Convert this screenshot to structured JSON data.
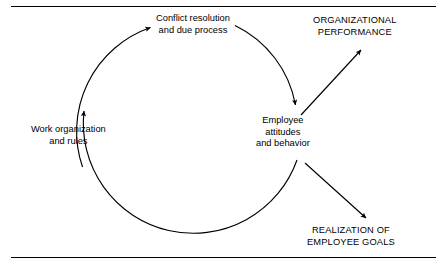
{
  "figure": {
    "type": "cycle-diagram",
    "rules": {
      "top": "horizontal-rule",
      "bottom": "horizontal-rule"
    }
  },
  "cycle": {
    "nodes": [
      {
        "id": "conflict-resolution",
        "lines": [
          "Conflict resolution",
          "and due process"
        ],
        "case": "sentence"
      },
      {
        "id": "employee-attitudes",
        "lines": [
          "Employee",
          "attitudes",
          "and behavior"
        ],
        "case": "sentence"
      },
      {
        "id": "work-organization",
        "lines": [
          "Work organization",
          "and rules"
        ],
        "case": "sentence"
      }
    ]
  },
  "outcomes": [
    {
      "id": "organizational-performance",
      "lines": [
        "ORGANIZATIONAL",
        "PERFORMANCE"
      ],
      "case": "upper"
    },
    {
      "id": "realization-of-employee-goals",
      "lines": [
        "REALIZATION OF",
        "EMPLOYEE GOALS"
      ],
      "case": "upper"
    }
  ],
  "arrows": [
    {
      "id": "work-to-conflict",
      "style": "curved",
      "from": "work-organization",
      "to": "conflict-resolution",
      "direction": "up-right"
    },
    {
      "id": "conflict-to-employee",
      "style": "curved",
      "from": "conflict-resolution",
      "to": "employee-attitudes",
      "direction": "down-right"
    },
    {
      "id": "employee-to-work",
      "style": "curved",
      "from": "employee-attitudes",
      "to": "work-organization",
      "direction": "up-left"
    },
    {
      "id": "employee-to-organizational-performance",
      "style": "straight",
      "from": "employee-attitudes",
      "to": "organizational-performance",
      "direction": "up-right"
    },
    {
      "id": "employee-to-employee-goals",
      "style": "straight",
      "from": "employee-attitudes",
      "to": "realization-of-employee-goals",
      "direction": "down-right"
    }
  ],
  "colors": {
    "stroke": "#000000",
    "text": "#000000",
    "background": "#ffffff"
  }
}
